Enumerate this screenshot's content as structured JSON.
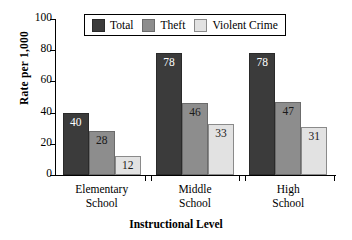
{
  "chart_data": {
    "type": "bar",
    "title": "",
    "xlabel": "Instructional Level",
    "ylabel": "Rate per 1,000",
    "categories": [
      "Elementary School",
      "Middle School",
      "High School"
    ],
    "category_lines": [
      [
        "Elementary",
        "School"
      ],
      [
        "Middle",
        "School"
      ],
      [
        "High",
        "School"
      ]
    ],
    "series": [
      {
        "name": "Total",
        "color": "#3b3b3b",
        "values": [
          40,
          78,
          78
        ]
      },
      {
        "name": "Theft",
        "color": "#8d8d8d",
        "values": [
          28,
          46,
          47
        ]
      },
      {
        "name": "Violent Crime",
        "color": "#e2e2e2",
        "values": [
          12,
          33,
          31
        ]
      }
    ],
    "ylim": [
      0,
      100
    ],
    "yticks": [
      0,
      20,
      40,
      60,
      80,
      100
    ],
    "ytick_labels": [
      "0",
      "20",
      "40",
      "60",
      "80",
      "100"
    ],
    "grid": false,
    "legend_position": "top-center",
    "value_labels": true
  }
}
